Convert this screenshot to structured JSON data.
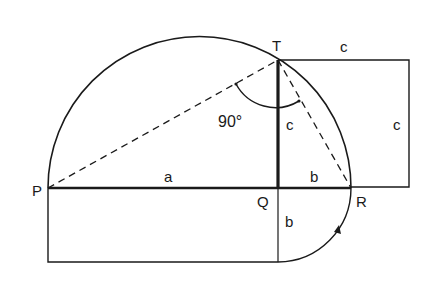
{
  "diagram": {
    "points": {
      "P": {
        "label": "P"
      },
      "Q": {
        "label": "Q"
      },
      "R": {
        "label": "R"
      },
      "T": {
        "label": "T"
      }
    },
    "segments": {
      "PQ": "a",
      "QR": "b",
      "QT": "c",
      "square_top": "c",
      "square_right": "c",
      "rect_side": "b"
    },
    "angle": {
      "at": "T",
      "value": "90°"
    },
    "colors": {
      "stroke": "#1a1a1a",
      "background": "#ffffff"
    }
  }
}
